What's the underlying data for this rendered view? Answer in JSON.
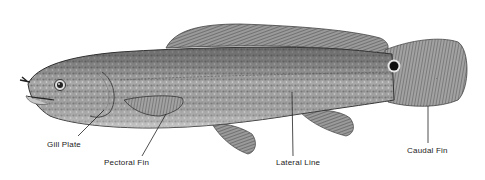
{
  "diagram": {
    "labels": [
      {
        "id": "gill-plate",
        "text": "Gill Plate"
      },
      {
        "id": "pectoral-fin",
        "text": "Pectoral Fin"
      },
      {
        "id": "lateral-line",
        "text": "Lateral Line"
      },
      {
        "id": "caudal-fin",
        "text": "Caudal Fin"
      }
    ]
  }
}
